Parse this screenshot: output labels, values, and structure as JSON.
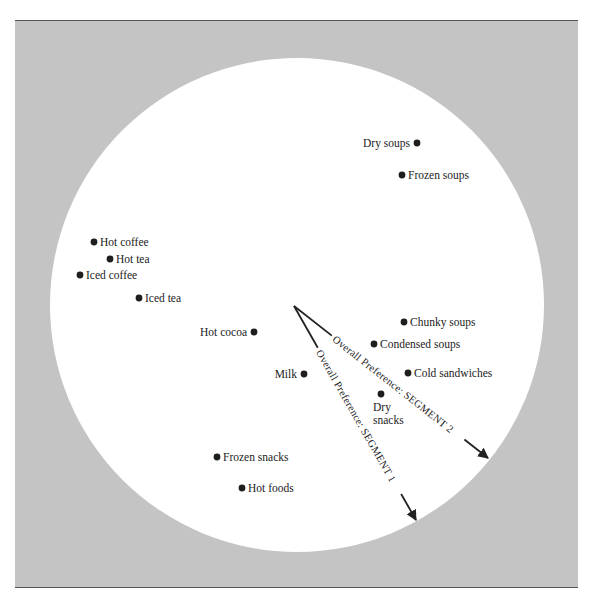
{
  "colors": {
    "background_frame": "#c4c4c4",
    "circle_fill": "#ffffff",
    "frame_border": "#555555",
    "ink": "#222222"
  },
  "figure": {
    "type": "perceptual-map",
    "circle": {
      "cx": 297,
      "cy": 305,
      "r": 247
    }
  },
  "points": [
    {
      "label": "Dry soups",
      "x": 417,
      "y": 143,
      "label_side": "left"
    },
    {
      "label": "Frozen soups",
      "x": 402,
      "y": 175,
      "label_side": "right"
    },
    {
      "label": "Hot coffee",
      "x": 94,
      "y": 242,
      "label_side": "right"
    },
    {
      "label": "Hot tea",
      "x": 110,
      "y": 259,
      "label_side": "right"
    },
    {
      "label": "Iced coffee",
      "x": 80,
      "y": 275,
      "label_side": "right"
    },
    {
      "label": "Iced tea",
      "x": 139,
      "y": 298,
      "label_side": "right"
    },
    {
      "label": "Hot cocoa",
      "x": 254,
      "y": 332,
      "label_side": "left"
    },
    {
      "label": "Chunky soups",
      "x": 404,
      "y": 322,
      "label_side": "right"
    },
    {
      "label": "Condensed soups",
      "x": 374,
      "y": 344,
      "label_side": "right"
    },
    {
      "label": "Milk",
      "x": 304,
      "y": 374,
      "label_side": "left"
    },
    {
      "label": "Cold sandwiches",
      "x": 408,
      "y": 373,
      "label_side": "right"
    },
    {
      "label": "Dry",
      "label2": "snacks",
      "x": 381,
      "y": 394,
      "label_side": "below"
    },
    {
      "label": "Frozen snacks",
      "x": 217,
      "y": 457,
      "label_side": "right"
    },
    {
      "label": "Hot foods",
      "x": 242,
      "y": 488,
      "label_side": "right"
    }
  ],
  "vectors": [
    {
      "label": "Overall Preference: SEGMENT 2",
      "origin": [
        294,
        306
      ],
      "tip": [
        488,
        458
      ]
    },
    {
      "label": "Overall Preference: SEGMENT 1",
      "origin": [
        294,
        306
      ],
      "tip": [
        416,
        520
      ]
    }
  ]
}
